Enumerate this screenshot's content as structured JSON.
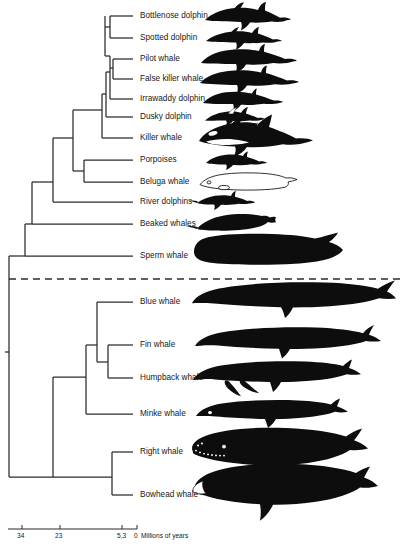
{
  "figure": {
    "type": "phylogenetic-tree",
    "divider": "dashed-line-separating-toothed-whales-from-baleen-whales"
  },
  "tips": [
    {
      "label": "Bottlenose dolphin",
      "y": 16,
      "branch_x": 133,
      "silhouette": "bottlenose-dolphin"
    },
    {
      "label": "Spotted dolphin",
      "y": 38,
      "branch_x": 133,
      "silhouette": "spotted-dolphin"
    },
    {
      "label": "Pilot whale",
      "y": 59,
      "branch_x": 133,
      "silhouette": "pilot-whale"
    },
    {
      "label": "False killer whale",
      "y": 79,
      "branch_x": 133,
      "silhouette": "false-killer-whale"
    },
    {
      "label": "Irrawaddy dolphin",
      "y": 99,
      "branch_x": 133,
      "silhouette": "irrawaddy-dolphin"
    },
    {
      "label": "Dusky dolphin",
      "y": 117,
      "branch_x": 133,
      "silhouette": "dusky-dolphin"
    },
    {
      "label": "Killer whale",
      "y": 138,
      "branch_x": 133,
      "silhouette": "killer-whale"
    },
    {
      "label": "Porpoises",
      "y": 160,
      "branch_x": 133,
      "silhouette": "porpoise"
    },
    {
      "label": "Beluga whale",
      "y": 182,
      "branch_x": 133,
      "silhouette": "beluga-whale"
    },
    {
      "label": "River dolphins",
      "y": 202,
      "branch_x": 133,
      "silhouette": "river-dolphin"
    },
    {
      "label": "Beaked whales",
      "y": 224,
      "branch_x": 133,
      "silhouette": "beaked-whale"
    },
    {
      "label": "Sperm whale",
      "y": 256,
      "branch_x": 133,
      "silhouette": "sperm-whale"
    },
    {
      "label": "Blue whale",
      "y": 302,
      "branch_x": 133,
      "silhouette": "blue-whale"
    },
    {
      "label": "Fin whale",
      "y": 345,
      "branch_x": 133,
      "silhouette": "fin-whale"
    },
    {
      "label": "Humpback whale",
      "y": 378,
      "branch_x": 133,
      "silhouette": "humpback-whale"
    },
    {
      "label": "Minke whale",
      "y": 414,
      "branch_x": 133,
      "silhouette": "minke-whale"
    },
    {
      "label": "Right whale",
      "y": 452,
      "branch_x": 133,
      "silhouette": "right-whale"
    },
    {
      "label": "Bowhead whale",
      "y": 495,
      "branch_x": 133,
      "silhouette": "bowhead-whale"
    }
  ],
  "axis": {
    "unit_label": "Millions of years",
    "line_x0": 8,
    "line_x1": 137,
    "y": 529,
    "ticks": [
      {
        "value": "34",
        "x": 22
      },
      {
        "value": "23",
        "x": 60
      },
      {
        "value": "5,3",
        "x": 122
      },
      {
        "value": "0",
        "x": 137
      }
    ]
  },
  "colors": {
    "ink": "#171717",
    "line": "#2b2b2b",
    "background": "#ffffff",
    "silhouette": "#0d0d0d"
  }
}
